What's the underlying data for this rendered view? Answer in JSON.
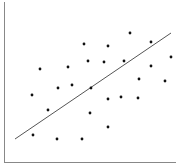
{
  "chart_data": {
    "type": "scatter",
    "title": "",
    "xlabel": "",
    "ylabel": "",
    "grid": false,
    "legend": null,
    "xlim": [
      0,
      100
    ],
    "ylim": [
      0,
      100
    ],
    "points": [
      {
        "x": 17,
        "y": 17
      },
      {
        "x": 31,
        "y": 14
      },
      {
        "x": 46,
        "y": 14
      },
      {
        "x": 61,
        "y": 22
      },
      {
        "x": 26,
        "y": 33
      },
      {
        "x": 50,
        "y": 31
      },
      {
        "x": 16,
        "y": 42
      },
      {
        "x": 32,
        "y": 47
      },
      {
        "x": 40,
        "y": 48
      },
      {
        "x": 51,
        "y": 46
      },
      {
        "x": 61,
        "y": 40
      },
      {
        "x": 69,
        "y": 41
      },
      {
        "x": 78,
        "y": 40
      },
      {
        "x": 21,
        "y": 58
      },
      {
        "x": 38,
        "y": 59
      },
      {
        "x": 49,
        "y": 63
      },
      {
        "x": 59,
        "y": 63
      },
      {
        "x": 70,
        "y": 63
      },
      {
        "x": 86,
        "y": 60
      },
      {
        "x": 47,
        "y": 74
      },
      {
        "x": 61,
        "y": 73
      },
      {
        "x": 74,
        "y": 81
      },
      {
        "x": 86,
        "y": 75
      },
      {
        "x": 98,
        "y": 66
      },
      {
        "x": 79,
        "y": 52
      },
      {
        "x": 94,
        "y": 51
      }
    ],
    "trendline": {
      "x1": 6,
      "y1": 15,
      "x2": 98,
      "y2": 80
    },
    "colors": {
      "points": "#111111",
      "trendline": "#555555",
      "axes": "#888888"
    }
  },
  "render": {
    "axis_origin": [
      4,
      162
    ],
    "axis_x_end": 176,
    "axis_y_top": 2,
    "trend_px": [
      15,
      139,
      171,
      33
    ],
    "points_px": [
      [
        33,
        135
      ],
      [
        57,
        139
      ],
      [
        82,
        139
      ],
      [
        108,
        127
      ],
      [
        48,
        110
      ],
      [
        90,
        113
      ],
      [
        32,
        95
      ],
      [
        58,
        88
      ],
      [
        72,
        85
      ],
      [
        91,
        88
      ],
      [
        108,
        99
      ],
      [
        121,
        97
      ],
      [
        138,
        98
      ],
      [
        40,
        69
      ],
      [
        68,
        67
      ],
      [
        88,
        61
      ],
      [
        104,
        62
      ],
      [
        124,
        61
      ],
      [
        151,
        66
      ],
      [
        84,
        44
      ],
      [
        108,
        46
      ],
      [
        130,
        33
      ],
      [
        151,
        42
      ],
      [
        171,
        57
      ],
      [
        139,
        79
      ],
      [
        165,
        81
      ]
    ]
  }
}
